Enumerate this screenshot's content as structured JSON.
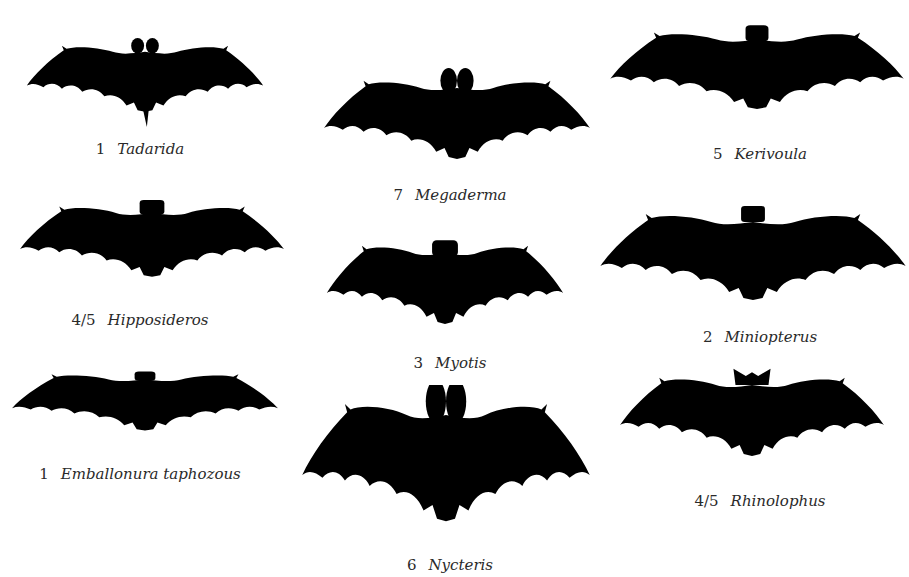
{
  "figure": {
    "background": "#ffffff",
    "silhouette_color": "#000000",
    "text_color": "#2a2a2a",
    "bats": [
      {
        "id": "tadarida",
        "number": "1",
        "name": "Tadarida"
      },
      {
        "id": "hipposideros",
        "number": "4/5",
        "name": "Hipposideros"
      },
      {
        "id": "emballonura",
        "number": "1",
        "name": "Emballonura taphozous"
      },
      {
        "id": "megaderma",
        "number": "7",
        "name": "Megaderma"
      },
      {
        "id": "myotis",
        "number": "3",
        "name": "Myotis"
      },
      {
        "id": "nycteris",
        "number": "6",
        "name": "Nycteris"
      },
      {
        "id": "kerivoula",
        "number": "5",
        "name": "Kerivoula"
      },
      {
        "id": "miniopterus",
        "number": "2",
        "name": "Miniopterus"
      },
      {
        "id": "rhinolophus",
        "number": "4/5",
        "name": "Rhinolophus"
      }
    ]
  }
}
